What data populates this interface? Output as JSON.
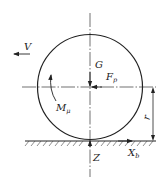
{
  "diagram": {
    "title": "",
    "labels": {
      "velocity": "V",
      "gravity": "G",
      "force_p": {
        "main": "F",
        "sub": "p"
      },
      "moment": {
        "main": "M",
        "sub": "μ"
      },
      "radius": "r",
      "normal": "Z",
      "tangential": {
        "main": "X",
        "sub": "b"
      }
    },
    "colors": {
      "stroke": "#222222",
      "background": "#ffffff"
    },
    "elements": [
      "wheel-circle",
      "horizontal-centerline",
      "vertical-centerline",
      "ground-line",
      "ground-hatching",
      "velocity-arrow",
      "gravity-arrow",
      "force-p-arrow",
      "moment-arrow",
      "radius-dimension",
      "normal-force-arrow",
      "tangential-force-arrow"
    ]
  }
}
